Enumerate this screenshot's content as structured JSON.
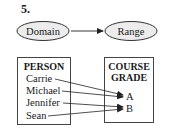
{
  "problem_number": "5.",
  "mapping_header": {
    "domain_label": "Domain",
    "range_label": "Range"
  },
  "domain_box": {
    "title": "PERSON",
    "items": [
      "Carrie",
      "Michael",
      "Jennifer",
      "Sean"
    ]
  },
  "range_box": {
    "title_line1": "COURSE",
    "title_line2": "GRADE",
    "items": [
      "A",
      "B"
    ]
  },
  "mappings": [
    {
      "from": "Carrie",
      "to": "A"
    },
    {
      "from": "Michael",
      "to": "A"
    },
    {
      "from": "Jennifer",
      "to": "B"
    },
    {
      "from": "Sean",
      "to": "B"
    }
  ],
  "colors": {
    "oval_fill": "#ececec",
    "stroke": "#333333",
    "text": "#1a1a1a"
  }
}
